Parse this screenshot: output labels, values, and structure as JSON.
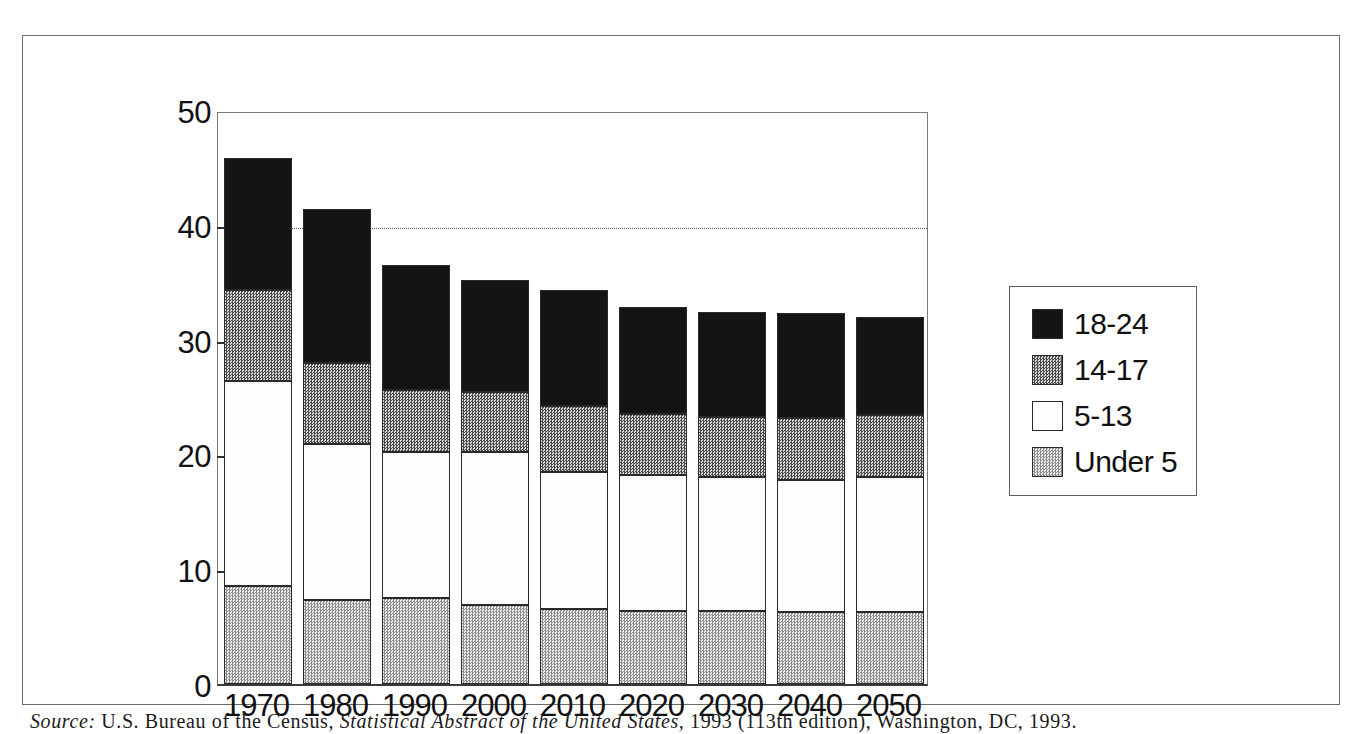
{
  "chart_data": {
    "type": "bar",
    "stacked": true,
    "title": "",
    "xlabel": "",
    "ylabel": "",
    "ylim": [
      0,
      50
    ],
    "ytick_step": 10,
    "ytick_labels": [
      "0",
      "10",
      "20",
      "30",
      "40",
      "50"
    ],
    "grid": "horizontal dotted gridline at 40",
    "legend_position": "right",
    "categories": [
      "1970",
      "1980",
      "1990",
      "2000",
      "2010",
      "2020",
      "2030",
      "2040",
      "2050"
    ],
    "series": [
      {
        "name": "Under 5",
        "color": "#dcdcdc",
        "pattern": "light-dither",
        "values": [
          8.5,
          7.3,
          7.5,
          6.9,
          6.5,
          6.4,
          6.4,
          6.3,
          6.3
        ]
      },
      {
        "name": "5-13",
        "color": "#fdfdfd",
        "pattern": "white",
        "values": [
          17.9,
          13.6,
          12.7,
          13.3,
          12.0,
          11.8,
          11.6,
          11.5,
          11.7
        ]
      },
      {
        "name": "14-17",
        "color": "#bdbdbd",
        "pattern": "medium-dither",
        "values": [
          7.9,
          7.1,
          5.4,
          5.2,
          5.7,
          5.3,
          5.3,
          5.4,
          5.4
        ]
      },
      {
        "name": "18-24",
        "color": "#141414",
        "pattern": "solid-black",
        "values": [
          11.5,
          13.4,
          10.9,
          9.8,
          10.1,
          9.3,
          9.1,
          9.1,
          8.6
        ]
      }
    ],
    "cumulative_tops": {
      "under_5": [
        8.5,
        7.3,
        7.5,
        6.9,
        6.5,
        6.4,
        6.4,
        6.3,
        6.3
      ],
      "5_13": [
        26.4,
        20.9,
        20.2,
        20.2,
        18.5,
        18.2,
        18.0,
        17.8,
        18.0
      ],
      "14_17": [
        34.3,
        28.0,
        25.6,
        25.4,
        24.2,
        23.5,
        23.3,
        23.2,
        23.4
      ],
      "18_24": [
        45.8,
        41.4,
        36.5,
        35.2,
        34.3,
        32.8,
        32.4,
        32.3,
        32.0
      ]
    },
    "totals": [
      45.8,
      41.4,
      36.5,
      35.2,
      34.3,
      32.8,
      32.4,
      32.3,
      32.0
    ]
  },
  "legend": {
    "entries": [
      {
        "label": "18-24",
        "swatch": "fill-1824"
      },
      {
        "label": "14-17",
        "swatch": "fill-1417"
      },
      {
        "label": "5-13",
        "swatch": "fill-513"
      },
      {
        "label": "Under 5",
        "swatch": "fill-under5"
      }
    ]
  },
  "caption": {
    "source_label": "Source:",
    "source_text_1": " U.S. Bureau of the Census, ",
    "source_italic": "Statistical Abstract of the United States,",
    "source_text_2": " 1993 (113th edition), Washington, DC, 1993."
  }
}
